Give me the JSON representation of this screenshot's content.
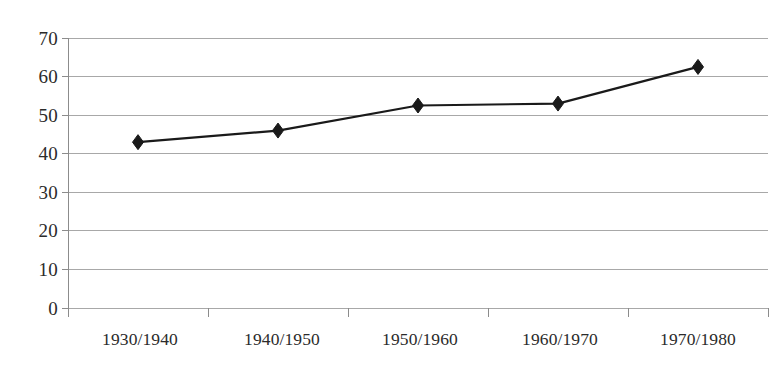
{
  "chart_data": {
    "type": "line",
    "title": "",
    "subtitle": "",
    "xlabel": "",
    "ylabel": "",
    "categories": [
      "1930/1940",
      "1940/1950",
      "1950/1960",
      "1960/1970",
      "1970/1980"
    ],
    "series": [
      {
        "name": "",
        "values": [
          43,
          46,
          52.5,
          53,
          62.5
        ],
        "marker": "diamond",
        "color": "#1a1a1a"
      }
    ],
    "ylim": [
      0,
      70
    ],
    "yticks": [
      0,
      10,
      20,
      30,
      40,
      50,
      60,
      70
    ],
    "ytick_labels": [
      "0",
      "10",
      "20",
      "30",
      "40",
      "50",
      "60",
      "70"
    ],
    "grid": true,
    "grid_axis": "y",
    "grid_color": "#a8a8a8",
    "axis_color": "#8c8c8c",
    "legend": false,
    "legend_position": "none",
    "background": "#ffffff"
  },
  "axes": {
    "y_axis_name": "value-axis",
    "x_axis_name": "period-axis"
  }
}
